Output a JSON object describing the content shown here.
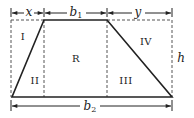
{
  "diagram": {
    "type": "trapezoid-decomposition",
    "colors": {
      "stroke": "#222222",
      "dashed": "#555555",
      "background": "#ffffff"
    },
    "dimensions": {
      "x": {
        "label": "x"
      },
      "b1": {
        "base": "b",
        "sub": "1"
      },
      "y": {
        "label": "y"
      },
      "b2": {
        "base": "b",
        "sub": "2"
      },
      "h": {
        "label": "h"
      }
    },
    "regions": {
      "I": "I",
      "II": "II",
      "R": "R",
      "III": "III",
      "IV": "IV"
    }
  }
}
